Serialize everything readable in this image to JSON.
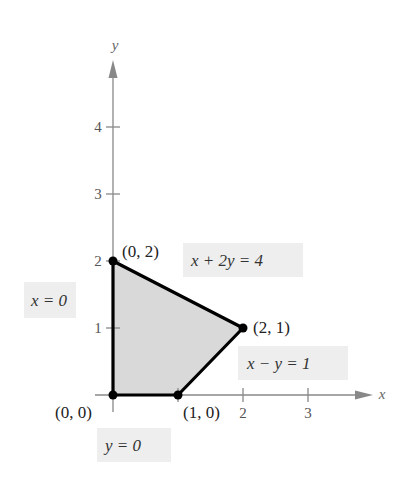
{
  "diagram": {
    "axes": {
      "x_label": "x",
      "y_label": "y",
      "x_ticks": [
        {
          "value": 1,
          "label": ""
        },
        {
          "value": 2,
          "label": "2"
        },
        {
          "value": 3,
          "label": "3"
        }
      ],
      "y_ticks": [
        {
          "value": 1,
          "label": "1"
        },
        {
          "value": 2,
          "label": "2"
        },
        {
          "value": 3,
          "label": "3"
        },
        {
          "value": 4,
          "label": "4"
        }
      ]
    },
    "region": {
      "fill_color": "#d9d9d9",
      "edge_color": "#000000",
      "vertices": [
        [
          0,
          0
        ],
        [
          1,
          0
        ],
        [
          2,
          1
        ],
        [
          0,
          2
        ]
      ]
    },
    "points": [
      {
        "label": "(0, 0)",
        "x": 0,
        "y": 0
      },
      {
        "label": "(1, 0)",
        "x": 1,
        "y": 0
      },
      {
        "label": "(2, 1)",
        "x": 2,
        "y": 1
      },
      {
        "label": "(0, 2)",
        "x": 0,
        "y": 2
      }
    ],
    "equations": {
      "x_eq_0": "x = 0",
      "y_eq_0": "y = 0",
      "x_plus_2y": "x + 2y = 4",
      "x_minus_y": "x − y = 1"
    }
  }
}
